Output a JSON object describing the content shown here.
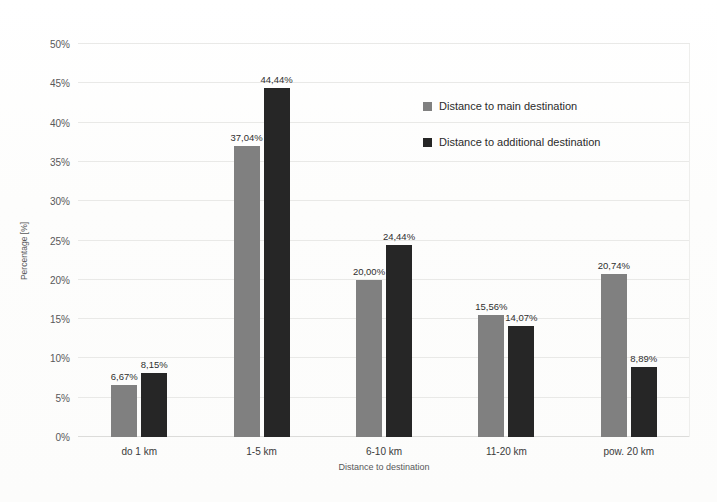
{
  "chart_data": {
    "type": "bar",
    "title": "",
    "xlabel": "Distance to destination",
    "ylabel": "Percentage [%]",
    "categories": [
      "do 1 km",
      "1-5 km",
      "6-10 km",
      "11-20 km",
      "pow. 20 km"
    ],
    "series": [
      {
        "name": "Distance to main destination",
        "color": "#808080",
        "values": [
          6.67,
          37.04,
          20.0,
          15.56,
          20.74
        ],
        "labels": [
          "6,67%",
          "37,04%",
          "20,00%",
          "15,56%",
          "20,74%"
        ]
      },
      {
        "name": "Distance to additional destination",
        "color": "#262626",
        "values": [
          8.15,
          44.44,
          24.44,
          14.07,
          8.89
        ],
        "labels": [
          "8,15%",
          "44,44%",
          "24,44%",
          "14,07%",
          "8,89%"
        ]
      }
    ],
    "ylim": [
      0,
      50
    ],
    "ytick_labels": [
      "0%",
      "5%",
      "10%",
      "15%",
      "20%",
      "25%",
      "30%",
      "35%",
      "40%",
      "45%",
      "50%"
    ],
    "ytick_values": [
      0,
      5,
      10,
      15,
      20,
      25,
      30,
      35,
      40,
      45,
      50
    ],
    "grid": true,
    "legend_position": "upper right"
  }
}
